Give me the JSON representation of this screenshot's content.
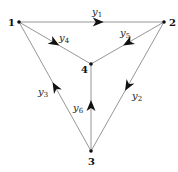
{
  "diagram": {
    "type": "directed-graph",
    "nodes": [
      {
        "id": "1",
        "label": "1",
        "x": 19,
        "y": 22,
        "lx": 8,
        "ly": 26
      },
      {
        "id": "2",
        "label": "2",
        "x": 164,
        "y": 22,
        "lx": 169,
        "ly": 26
      },
      {
        "id": "3",
        "label": "3",
        "x": 91,
        "y": 151,
        "lx": 88,
        "ly": 165
      },
      {
        "id": "4",
        "label": "4",
        "x": 91,
        "y": 64,
        "lx": 81,
        "ly": 73
      }
    ],
    "edges": [
      {
        "id": "y1",
        "var": "y",
        "sub": "1",
        "from": "1",
        "to": "2",
        "label_x": 92,
        "label_y": 15,
        "arrow_t": 0.55
      },
      {
        "id": "y2",
        "var": "y",
        "sub": "2",
        "from": "2",
        "to": "3",
        "label_x": 132,
        "label_y": 99,
        "arrow_t": 0.5
      },
      {
        "id": "y3",
        "var": "y",
        "sub": "3",
        "from": "3",
        "to": "1",
        "label_x": 38,
        "label_y": 95,
        "arrow_t": 0.5
      },
      {
        "id": "y4",
        "var": "y",
        "sub": "4",
        "from": "1",
        "to": "4",
        "label_x": 59,
        "label_y": 41,
        "arrow_t": 0.5
      },
      {
        "id": "y5",
        "var": "y",
        "sub": "5",
        "from": "2",
        "to": "4",
        "label_x": 120,
        "label_y": 36,
        "arrow_t": 0.5
      },
      {
        "id": "y6",
        "var": "y",
        "sub": "6",
        "from": "3",
        "to": "4",
        "label_x": 73,
        "label_y": 111,
        "arrow_t": 0.53
      }
    ],
    "colors": {
      "edge": "#8a8a8a",
      "node": "#111111",
      "arrow": "#111111",
      "text": "#111111"
    }
  }
}
